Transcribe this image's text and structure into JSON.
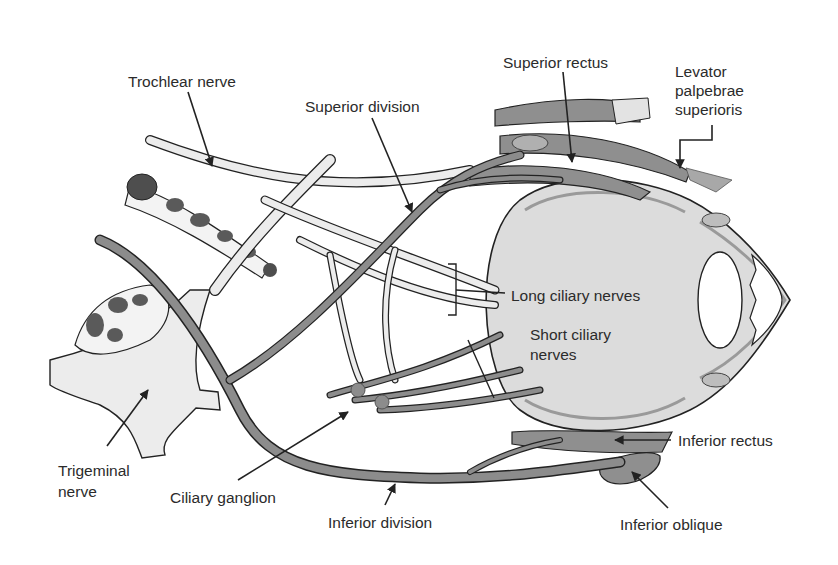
{
  "diagram": {
    "colors": {
      "background": "#ffffff",
      "nerve_dark": "#8c8c8c",
      "structure_light": "#ececec",
      "eyeball": "#dcdcdc",
      "muscle": "#8f8f8f",
      "vessel_spots": "#5a5a5a",
      "outline": "#222222",
      "label_text": "#2b2b2b"
    },
    "labels": {
      "trochlear_nerve": "Trochlear nerve",
      "superior_division": "Superior division",
      "superior_rectus": "Superior rectus",
      "levator_line1": "Levator",
      "levator_line2": "palpebrae",
      "levator_line3": "superioris",
      "long_ciliary_nerves": "Long ciliary nerves",
      "short_ciliary_line1": "Short ciliary",
      "short_ciliary_line2": "nerves",
      "trigeminal_line1": "Trigeminal",
      "trigeminal_line2": "nerve",
      "ciliary_ganglion": "Ciliary ganglion",
      "inferior_division": "Inferior division",
      "inferior_rectus": "Inferior rectus",
      "inferior_oblique": "Inferior oblique"
    }
  }
}
